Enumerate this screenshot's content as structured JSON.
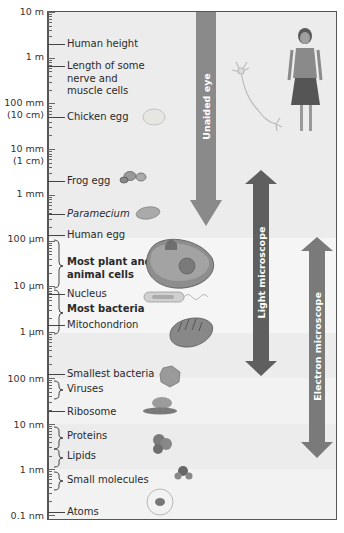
{
  "scale_labels": [
    {
      "text": "10 m",
      "sub": ""
    },
    {
      "text": "1 m",
      "sub": ""
    },
    {
      "text": "100 mm",
      "sub": "(10 cm)"
    },
    {
      "text": "10 mm",
      "sub": "(1 cm)"
    },
    {
      "text": "1 mm",
      "sub": ""
    },
    {
      "text": "100 µm",
      "sub": ""
    },
    {
      "text": "10 µm",
      "sub": ""
    },
    {
      "text": "1 µm",
      "sub": ""
    },
    {
      "text": "100 nm",
      "sub": ""
    },
    {
      "text": "10 nm",
      "sub": ""
    },
    {
      "text": "1 nm",
      "sub": ""
    },
    {
      "text": "0.1 nm",
      "sub": ""
    }
  ],
  "items": [
    {
      "label": "Human height",
      "style": "normal"
    },
    {
      "label": "Length of some nerve and muscle cells",
      "line1": "Length of some",
      "line2": "nerve and",
      "line3": "muscle cells",
      "style": "normal"
    },
    {
      "label": "Chicken egg",
      "style": "normal"
    },
    {
      "label": "Frog egg",
      "style": "normal"
    },
    {
      "label": "Paramecium",
      "style": "italic"
    },
    {
      "label": "Human egg",
      "style": "normal"
    },
    {
      "label": "Most plant and animal cells",
      "line1": "Most plant and",
      "line2": "animal cells",
      "style": "bold"
    },
    {
      "label": "Nucleus",
      "style": "normal"
    },
    {
      "label": "Most bacteria",
      "style": "bold"
    },
    {
      "label": "Mitochondrion",
      "style": "normal"
    },
    {
      "label": "Smallest bacteria",
      "style": "normal"
    },
    {
      "label": "Viruses",
      "style": "normal"
    },
    {
      "label": "Ribosome",
      "style": "normal"
    },
    {
      "label": "Proteins",
      "style": "normal"
    },
    {
      "label": "Lipids",
      "style": "normal"
    },
    {
      "label": "Small molecules",
      "style": "normal"
    },
    {
      "label": "Atoms",
      "style": "normal"
    }
  ],
  "arrows": {
    "unaided_eye": {
      "label": "Unaided eye",
      "range": [
        "10 m",
        "~200 µm"
      ],
      "color": "#8a8a8a"
    },
    "light_microscope": {
      "label": "Light microscope",
      "range": [
        "1 mm",
        "~200 nm"
      ],
      "color": "#5f5f5f"
    },
    "electron_microscope": {
      "label": "Electron microscope",
      "range": [
        "100 µm",
        "~1 nm"
      ],
      "color": "#7a7a7a"
    }
  },
  "colors": {
    "background": "#ececec",
    "band_light": "#f3f3f3",
    "axis": "#555555"
  }
}
